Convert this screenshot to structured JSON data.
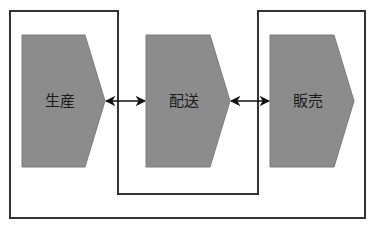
{
  "diagram": {
    "type": "process-flow",
    "colors": {
      "background": "#ffffff",
      "shape_fill": "#8c8c8c",
      "shape_stroke": "#7a7a7a",
      "outline": "#333333",
      "arrow": "#111111",
      "text": "#1a1a1a"
    },
    "steps": [
      {
        "id": "production",
        "label": "生産"
      },
      {
        "id": "delivery",
        "label": "配送"
      },
      {
        "id": "sales",
        "label": "販売"
      }
    ],
    "connections": [
      {
        "from": "production",
        "to": "delivery",
        "direction": "bidirectional"
      },
      {
        "from": "delivery",
        "to": "sales",
        "direction": "bidirectional"
      }
    ],
    "grouping": {
      "description": "Single continuous outline enclosing 生産 and 販売, with 配送 outside (notched region)"
    }
  }
}
